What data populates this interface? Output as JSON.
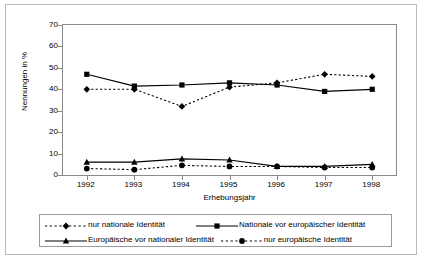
{
  "chart_data": {
    "type": "line",
    "title": "",
    "xlabel": "Erhebungsjahr",
    "ylabel": "Nennungen in %",
    "x": [
      1992,
      1993,
      1994,
      1995,
      1996,
      1997,
      1998
    ],
    "xticklabels": [
      "1992",
      "1993",
      "1994",
      "1995",
      "1996",
      "1997",
      "1998"
    ],
    "yticklabels": [
      "0",
      "10",
      "20",
      "30",
      "40",
      "50",
      "60",
      "70"
    ],
    "yticks": [
      0,
      10,
      20,
      30,
      40,
      50,
      60,
      70
    ],
    "ylim": [
      0,
      70
    ],
    "grid": false,
    "legend_position": "below",
    "series": [
      {
        "name": "nur nationale Identität",
        "values": [
          40,
          40,
          32,
          41,
          43,
          47,
          46
        ],
        "linestyle": "dotted",
        "marker": "diamond",
        "color": "#000000"
      },
      {
        "name": "Nationale vor europäischer Identität",
        "values": [
          47,
          41.5,
          42,
          43,
          42,
          39,
          40
        ],
        "linestyle": "solid",
        "marker": "square",
        "color": "#000000"
      },
      {
        "name": "Europäische vor nationaler Identität",
        "values": [
          6,
          6,
          7.5,
          7,
          4,
          4,
          5
        ],
        "linestyle": "solid",
        "marker": "triangle",
        "color": "#000000"
      },
      {
        "name": "nur europäische Identität",
        "values": [
          3,
          2.5,
          4.5,
          4,
          4,
          3.5,
          3.5
        ],
        "linestyle": "dotted",
        "marker": "circle",
        "color": "#000000"
      }
    ]
  },
  "legend": {
    "entries": [
      {
        "label": "nur nationale Identität"
      },
      {
        "label": "Nationale vor europäischer Identität"
      },
      {
        "label": "Europäische vor nationaler Identität"
      },
      {
        "label": "nur europäische Identität"
      }
    ]
  }
}
